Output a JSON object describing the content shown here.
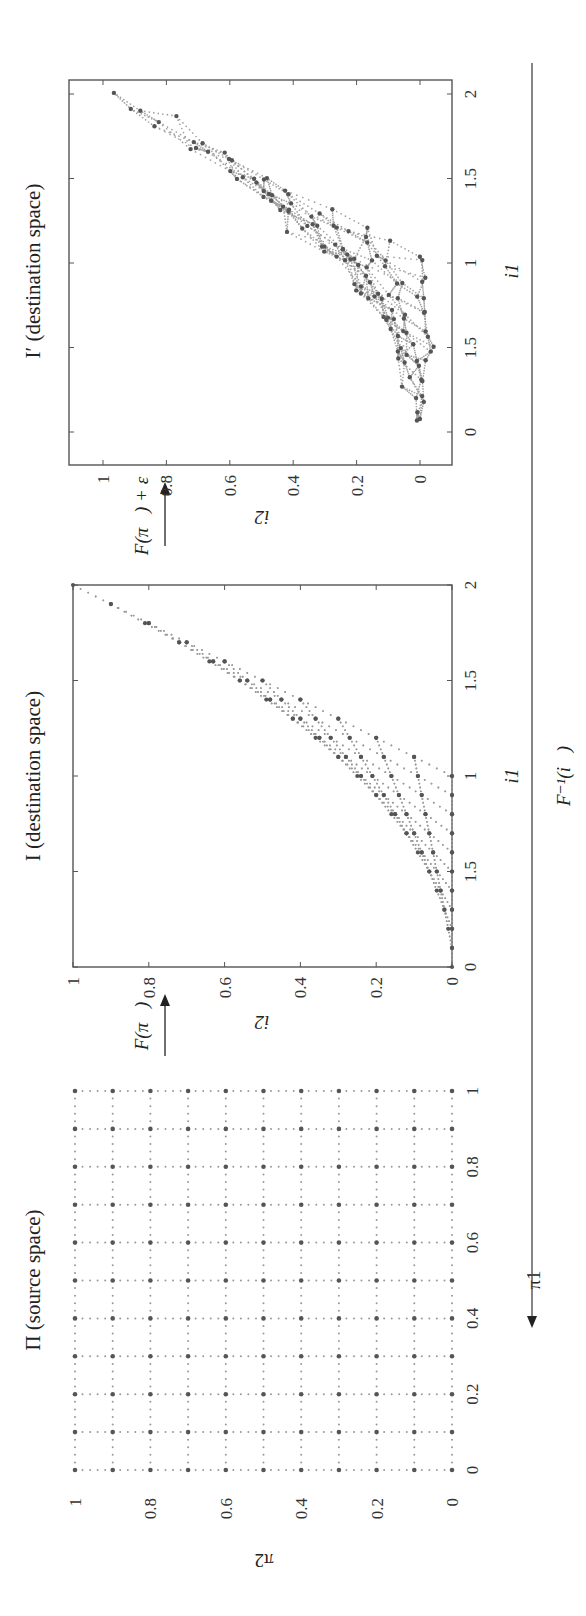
{
  "figure": {
    "orientation": "rotated 90° counter-clockwise",
    "arrow_labels": {
      "forward": "F(π⃗)",
      "forward_noisy": "F(π⃗) + ε",
      "inverse": "F⁻¹(i⃗)"
    },
    "colors": {
      "marker": "#555555",
      "dots": "#888888",
      "frame": "#555555",
      "text": "#222222"
    }
  },
  "chart_data": [
    {
      "type": "scatter",
      "title": "Π (source space)",
      "xlabel": "π1",
      "ylabel": "π2",
      "xlim": [
        0,
        1
      ],
      "ylim": [
        0,
        1
      ],
      "xticks": [
        "0",
        "0.2",
        "0.4",
        "0.6",
        "0.8",
        "1"
      ],
      "yticks": [
        "0",
        "0.2",
        "0.4",
        "0.6",
        "0.8",
        "1"
      ],
      "grid_step_major": 0.1,
      "grid_step_minor": 0.02,
      "frame": false,
      "description": "Regular 11×11 grid of sample points over [0,1]×[0,1] with dotted connecting lines"
    },
    {
      "type": "scatter",
      "title": "I (destination space)",
      "xlabel": "i1",
      "ylabel": "i2",
      "xlim": [
        0,
        2
      ],
      "ylim": [
        0,
        1
      ],
      "xticks": [
        "0",
        "1.5",
        "1",
        "1.5",
        "2"
      ],
      "xtick_values": [
        0,
        0.5,
        1,
        1.5,
        2
      ],
      "yticks": [
        "0",
        "0.2",
        "0.4",
        "0.6",
        "0.8",
        "1"
      ],
      "mapping": "i1 = π1 + π2, i2 = π1 · π2",
      "frame": true
    },
    {
      "type": "scatter",
      "title": "I′ (destination space)",
      "xlabel": "i1",
      "ylabel": "i2",
      "xlim": [
        -0.1,
        2.1
      ],
      "ylim": [
        -0.05,
        1.1
      ],
      "xticks": [
        "0",
        "1.5",
        "1",
        "1.5",
        "2"
      ],
      "xtick_values": [
        0,
        0.5,
        1,
        1.5,
        2
      ],
      "yticks": [
        "0",
        "0.2",
        "0.4",
        "0.6",
        "0.8",
        "1"
      ],
      "mapping": "i⃗ = F(π⃗) + ε (noisy observation)",
      "noise_sd": 0.03,
      "frame": true
    }
  ]
}
